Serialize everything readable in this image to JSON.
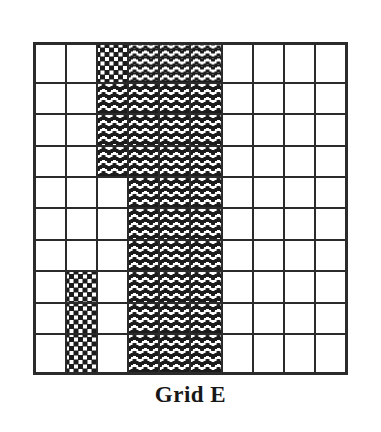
{
  "figure": {
    "caption": "Grid E",
    "grid": {
      "rows": 10,
      "columns": 10,
      "border_color": "#2b2b2b",
      "legend": {
        "gray": "solid light gray fill",
        "dotted": "dark scattered dots fill",
        "wavy": "horizontal wavy lines fill",
        "white": "empty white fill"
      },
      "counts": {
        "gray": 17,
        "dotted": 4,
        "wavy": 33,
        "white": 46
      },
      "cells": [
        [
          "gray",
          "gray",
          "dotted",
          "wavy",
          "wavy",
          "wavy",
          "white",
          "white",
          "white",
          "white"
        ],
        [
          "gray",
          "gray",
          "wavy",
          "wavy",
          "wavy",
          "wavy",
          "white",
          "white",
          "white",
          "white"
        ],
        [
          "gray",
          "gray",
          "wavy",
          "wavy",
          "wavy",
          "wavy",
          "white",
          "white",
          "white",
          "white"
        ],
        [
          "gray",
          "gray",
          "wavy",
          "wavy",
          "wavy",
          "wavy",
          "white",
          "white",
          "white",
          "white"
        ],
        [
          "gray",
          "gray",
          "white",
          "wavy",
          "wavy",
          "wavy",
          "white",
          "white",
          "white",
          "white"
        ],
        [
          "gray",
          "gray",
          "white",
          "wavy",
          "wavy",
          "wavy",
          "white",
          "white",
          "white",
          "white"
        ],
        [
          "gray",
          "gray",
          "white",
          "wavy",
          "wavy",
          "wavy",
          "white",
          "white",
          "white",
          "white"
        ],
        [
          "gray",
          "dotted",
          "white",
          "wavy",
          "wavy",
          "wavy",
          "white",
          "white",
          "white",
          "white"
        ],
        [
          "gray",
          "dotted",
          "white",
          "wavy",
          "wavy",
          "wavy",
          "white",
          "white",
          "white",
          "white"
        ],
        [
          "gray",
          "dotted",
          "white",
          "wavy",
          "wavy",
          "wavy",
          "white",
          "white",
          "white",
          "white"
        ]
      ]
    }
  }
}
